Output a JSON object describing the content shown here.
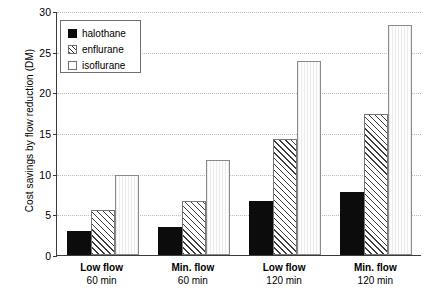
{
  "chart_data": {
    "type": "bar",
    "title": "",
    "xlabel": "",
    "ylabel": "Cost savings by flow reduction (DM)",
    "ylim": [
      0,
      30
    ],
    "yticks": [
      0,
      5,
      10,
      15,
      20,
      25,
      30
    ],
    "ytick_labels": [
      "0",
      "5",
      "10",
      "15",
      "20",
      "25",
      "30"
    ],
    "grid": true,
    "grid_axis": "y",
    "legend_position": "upper left",
    "categories": [
      {
        "line1": "Low flow",
        "line2": "60 min"
      },
      {
        "line1": "Min. flow",
        "line2": "60 min"
      },
      {
        "line1": "Low flow",
        "line2": "120 min"
      },
      {
        "line1": "Min. flow",
        "line2": "120 min"
      }
    ],
    "category_labels": [
      "Low flow 60 min",
      "Min. flow 60 min",
      "Low flow 120 min",
      "Min. flow 120 min"
    ],
    "series": [
      {
        "name": "halothane",
        "fill": "solid-black",
        "color": "#0c0c0c",
        "values": [
          2.9,
          3.5,
          6.7,
          7.7
        ]
      },
      {
        "name": "enflurane",
        "fill": "diagonal-hatch",
        "color": "#3d3d3d",
        "values": [
          5.5,
          6.7,
          14.3,
          17.3
        ]
      },
      {
        "name": "isoflurane",
        "fill": "white",
        "color": "#fdfdfd",
        "values": [
          9.8,
          11.7,
          23.8,
          28.3
        ]
      }
    ]
  },
  "legend": {
    "items": [
      {
        "label": "halothane",
        "style": "halothane"
      },
      {
        "label": "enflurane",
        "style": "enflurane"
      },
      {
        "label": "isoflurane",
        "style": "isoflurane"
      }
    ]
  }
}
